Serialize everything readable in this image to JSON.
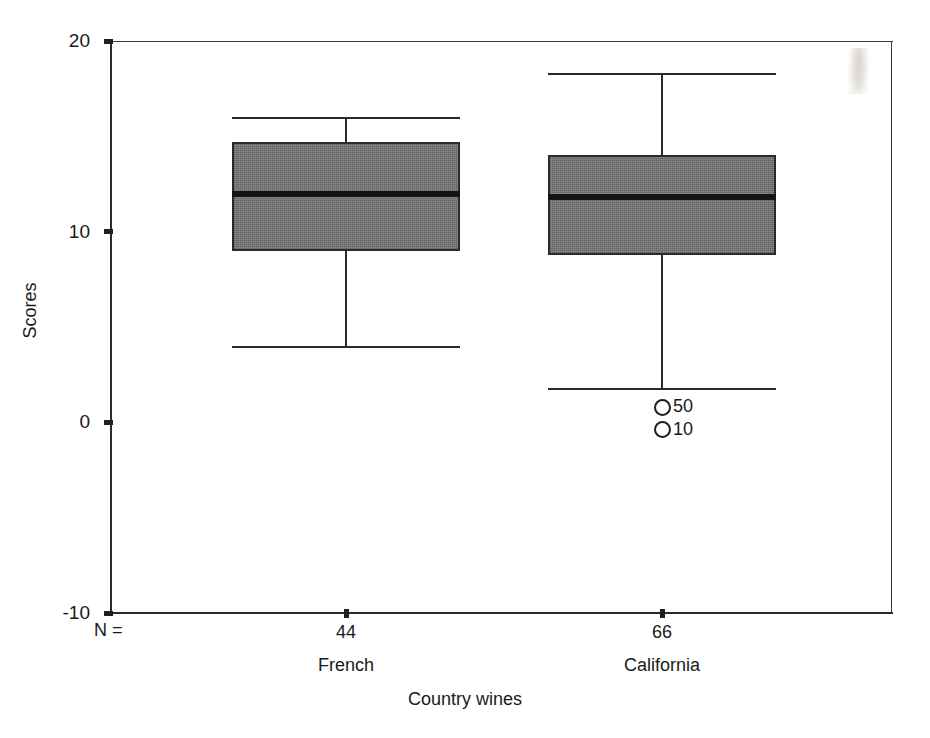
{
  "chart_data": {
    "type": "box",
    "title": "",
    "xlabel": "Country wines",
    "ylabel": "Scores",
    "ylim": [
      -10,
      20
    ],
    "yticks": [
      {
        "value": 20,
        "label": "20"
      },
      {
        "value": 10,
        "label": "10"
      },
      {
        "value": 0,
        "label": "0"
      },
      {
        "value": -10,
        "label": "-10"
      }
    ],
    "grid": false,
    "legend": "none",
    "n_prefix_label": "N =",
    "categories": [
      "French",
      "California"
    ],
    "counts": [
      "44",
      "66"
    ],
    "boxes": [
      {
        "category": "French",
        "n": "44",
        "whisker_low": 4.0,
        "q1": 9.0,
        "median": 12.0,
        "q3": 14.7,
        "whisker_high": 16.0,
        "outliers": []
      },
      {
        "category": "California",
        "n": "66",
        "whisker_low": 1.8,
        "q1": 8.8,
        "median": 11.8,
        "q3": 14.0,
        "whisker_high": 18.3,
        "outliers": [
          {
            "value": 0.8,
            "label": "50"
          },
          {
            "value": -0.4,
            "label": "10"
          }
        ]
      }
    ],
    "colors": {
      "box_fill": "#7a7a7a",
      "box_edge": "#2a2a2a",
      "median": "#141414",
      "axis": "#202020",
      "text": "#1a1a1a",
      "background": "#ffffff"
    }
  }
}
